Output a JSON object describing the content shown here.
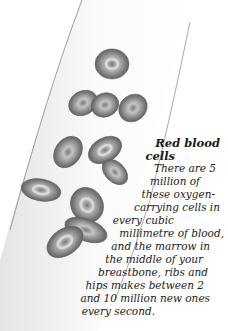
{
  "illustration": {
    "subject": "red blood cells in a blood vessel",
    "cell_count": 13,
    "colors": {
      "vessel_edge": "#9a9a9a",
      "vessel_fill": "#f2f2f2",
      "cell_dark": "#6e6e6e",
      "cell_light": "#c8c8c8"
    }
  },
  "caption": {
    "title_line1": "Red blood",
    "title_line2": "cells",
    "lines": [
      "There are 5",
      "million of",
      "these oxygen-",
      "carrying cells in",
      "every cubic",
      "millimetre of blood,",
      "and the marrow in",
      "the middle of your",
      "breastbone, ribs and",
      "hips makes between 2",
      "and 10 million new ones",
      "every second."
    ]
  }
}
